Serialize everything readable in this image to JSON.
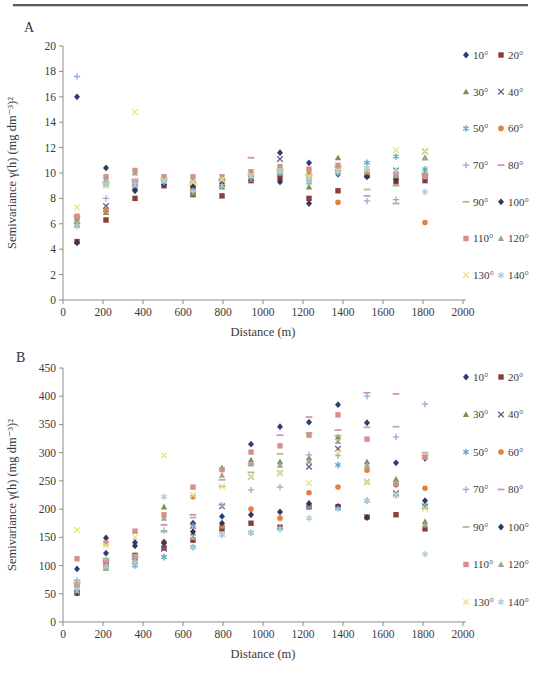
{
  "page": {
    "panel_a_label": "A",
    "panel_b_label": "B"
  },
  "chart_data": [
    {
      "id": "A",
      "type": "scatter",
      "title": "",
      "xlabel": "Distance (m)",
      "ylabel": "Semivariance γ(h) (mg dm⁻³)²",
      "xlim": [
        0,
        2000
      ],
      "xtick_step": 200,
      "ylim": [
        0,
        20
      ],
      "ytick_step": 2,
      "grid": false,
      "legend_position": "right",
      "x": [
        70,
        215,
        360,
        505,
        650,
        795,
        940,
        1085,
        1230,
        1375,
        1520,
        1665,
        1810
      ],
      "series": [
        {
          "name": "10°",
          "marker": "diamond",
          "color": "#2F3E6E",
          "values": [
            16.0,
            7.0,
            8.7,
            9.1,
            8.8,
            9.0,
            9.6,
            11.6,
            10.8,
            9.9,
            9.9,
            9.7,
            9.9
          ]
        },
        {
          "name": "20°",
          "marker": "square",
          "color": "#8B3D3B",
          "values": [
            4.6,
            6.3,
            8.0,
            9.0,
            8.3,
            8.2,
            9.4,
            9.6,
            8.0,
            8.6,
            9.8,
            9.3,
            9.4
          ]
        },
        {
          "name": "30°",
          "marker": "triangle",
          "color": "#7D9150",
          "values": [
            6.2,
            6.9,
            9.1,
            9.2,
            8.4,
            8.9,
            9.5,
            10.0,
            8.9,
            11.2,
            10.0,
            9.8,
            11.2
          ]
        },
        {
          "name": "40°",
          "marker": "x",
          "color": "#6C5A8C",
          "values": [
            5.9,
            7.4,
            9.2,
            9.3,
            8.8,
            9.1,
            9.6,
            11.1,
            9.7,
            10.3,
            9.9,
            10.2,
            11.7
          ]
        },
        {
          "name": "50°",
          "marker": "asterisk",
          "color": "#62A8C5",
          "values": [
            6.4,
            9.1,
            9.0,
            9.4,
            8.7,
            9.3,
            9.7,
            10.2,
            9.5,
            10.1,
            10.8,
            11.3,
            10.3
          ]
        },
        {
          "name": "60°",
          "marker": "circle",
          "color": "#DE8244",
          "values": [
            6.5,
            7.0,
            9.2,
            9.3,
            8.8,
            9.2,
            9.8,
            10.4,
            9.9,
            7.7,
            10.0,
            9.6,
            6.1
          ]
        },
        {
          "name": "70°",
          "marker": "plus",
          "color": "#92AFD2",
          "values": [
            17.6,
            8.0,
            9.3,
            9.5,
            9.0,
            9.4,
            9.9,
            10.1,
            9.6,
            10.2,
            7.8,
            7.9,
            9.7
          ]
        },
        {
          "name": "80°",
          "marker": "dash",
          "color": "#D691B4",
          "values": [
            6.6,
            9.3,
            9.4,
            9.6,
            9.1,
            9.5,
            11.2,
            10.3,
            9.8,
            10.5,
            8.2,
            7.6,
            9.8
          ]
        },
        {
          "name": "90°",
          "marker": "dash",
          "color": "#A9BE90",
          "values": [
            6.1,
            9.2,
            9.5,
            9.5,
            9.2,
            9.4,
            10.0,
            10.0,
            9.9,
            10.4,
            8.7,
            9.0,
            10.0
          ]
        },
        {
          "name": "100°",
          "marker": "diamond",
          "color": "#35355F",
          "values": [
            4.5,
            10.4,
            8.6,
            9.1,
            8.9,
            9.1,
            9.7,
            9.3,
            7.6,
            10.0,
            9.7,
            9.5,
            9.6
          ]
        },
        {
          "name": "110°",
          "marker": "square",
          "color": "#D78F8D",
          "values": [
            6.6,
            9.7,
            10.2,
            9.7,
            9.7,
            9.7,
            10.1,
            10.5,
            10.3,
            10.6,
            10.1,
            9.9,
            9.7
          ]
        },
        {
          "name": "120°",
          "marker": "triangle",
          "color": "#A3A696",
          "values": [
            6.0,
            9.5,
            10.0,
            9.6,
            9.5,
            9.6,
            9.9,
            10.4,
            9.3,
            10.3,
            10.2,
            9.8,
            11.2
          ]
        },
        {
          "name": "130°",
          "marker": "x",
          "color": "#E9E47E",
          "values": [
            7.3,
            9.0,
            14.8,
            9.4,
            9.3,
            9.5,
            9.8,
            10.2,
            9.7,
            10.2,
            10.3,
            11.8,
            11.7
          ]
        },
        {
          "name": "140°",
          "marker": "asterisk",
          "color": "#A8CFDC",
          "values": [
            5.8,
            9.2,
            9.1,
            9.3,
            8.6,
            9.0,
            9.7,
            10.1,
            9.4,
            10.0,
            10.4,
            10.2,
            8.5
          ]
        }
      ]
    },
    {
      "id": "B",
      "type": "scatter",
      "title": "",
      "xlabel": "Distance (m)",
      "ylabel": "Semivariance γ(h) (mg dm⁻³)²",
      "xlim": [
        0,
        2000
      ],
      "xtick_step": 200,
      "ylim": [
        0,
        450
      ],
      "ytick_step": 50,
      "grid": false,
      "legend_position": "right",
      "x": [
        70,
        215,
        360,
        505,
        650,
        795,
        940,
        1085,
        1230,
        1375,
        1520,
        1665,
        1810
      ],
      "series": [
        {
          "name": "10°",
          "marker": "diamond",
          "color": "#2F3E6E",
          "values": [
            94,
            122,
            141,
            142,
            175,
            187,
            315,
            346,
            354,
            385,
            353,
            282,
            290
          ]
        },
        {
          "name": "20°",
          "marker": "square",
          "color": "#8B3D3B",
          "values": [
            52,
            104,
            118,
            131,
            145,
            165,
            175,
            168,
            204,
            204,
            186,
            190,
            165
          ]
        },
        {
          "name": "30°",
          "marker": "triangle",
          "color": "#7D9150",
          "values": [
            51,
            97,
            110,
            204,
            158,
            273,
            287,
            284,
            291,
            328,
            284,
            253,
            178
          ]
        },
        {
          "name": "40°",
          "marker": "x",
          "color": "#6C5A8C",
          "values": [
            58,
            103,
            115,
            130,
            170,
            205,
            257,
            264,
            275,
            307,
            248,
            228,
            205
          ]
        },
        {
          "name": "50°",
          "marker": "asterisk",
          "color": "#62A8C5",
          "values": [
            60,
            100,
            100,
            115,
            133,
            155,
            158,
            165,
            204,
            278,
            215,
            225,
            205
          ]
        },
        {
          "name": "60°",
          "marker": "circle",
          "color": "#DE8244",
          "values": [
            65,
            103,
            112,
            141,
            222,
            170,
            200,
            184,
            229,
            239,
            269,
            243,
            237
          ]
        },
        {
          "name": "70°",
          "marker": "plus",
          "color": "#92AFD2",
          "values": [
            74,
            110,
            113,
            162,
            170,
            207,
            234,
            239,
            296,
            295,
            400,
            328,
            386
          ]
        },
        {
          "name": "80°",
          "marker": "dash",
          "color": "#D691B4",
          "values": [
            70,
            108,
            116,
            172,
            190,
            252,
            280,
            331,
            363,
            340,
            406,
            404,
            295
          ]
        },
        {
          "name": "90°",
          "marker": "dash",
          "color": "#A9BE90",
          "values": [
            68,
            112,
            119,
            160,
            185,
            240,
            265,
            298,
            335,
            330,
            345,
            346,
            300
          ]
        },
        {
          "name": "100°",
          "marker": "diamond",
          "color": "#35355F",
          "values": [
            51,
            149,
            135,
            140,
            160,
            175,
            190,
            195,
            210,
            205,
            185,
            245,
            215
          ]
        },
        {
          "name": "110°",
          "marker": "square",
          "color": "#D78F8D",
          "values": [
            112,
            140,
            161,
            190,
            239,
            270,
            301,
            312,
            331,
            367,
            324,
            245,
            292
          ]
        },
        {
          "name": "120°",
          "marker": "triangle",
          "color": "#A3A696",
          "values": [
            55,
            95,
            108,
            184,
            150,
            260,
            280,
            278,
            285,
            320,
            278,
            248,
            172
          ]
        },
        {
          "name": "130°",
          "marker": "x",
          "color": "#E9E47E",
          "values": [
            163,
            135,
            150,
            295,
            225,
            240,
            257,
            264,
            246,
            300,
            248,
            225,
            200
          ]
        },
        {
          "name": "140°",
          "marker": "asterisk",
          "color": "#A8CFDC",
          "values": [
            60,
            98,
            105,
            222,
            132,
            155,
            158,
            165,
            184,
            200,
            215,
            225,
            120
          ]
        }
      ]
    }
  ]
}
